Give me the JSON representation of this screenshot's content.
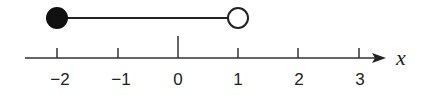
{
  "number_line": {
    "axis_variable": "x",
    "ticks": [
      {
        "value": -2,
        "label": "−2"
      },
      {
        "value": -1,
        "label": "−1"
      },
      {
        "value": 0,
        "label": "0"
      },
      {
        "value": 1,
        "label": "1"
      },
      {
        "value": 2,
        "label": "2"
      },
      {
        "value": 3,
        "label": "3"
      }
    ],
    "interval": {
      "start": -2,
      "start_closed": true,
      "end": 1,
      "end_closed": false,
      "notation": "[-2, 1)"
    },
    "colors": {
      "line": "#222222",
      "fill": "#111111",
      "open_fill": "#ffffff"
    }
  }
}
